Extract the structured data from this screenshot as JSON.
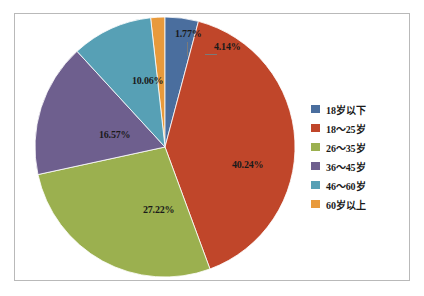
{
  "chart_data": {
    "type": "pie",
    "title": "",
    "xlabel": "",
    "ylabel": "",
    "legend_position": "right",
    "grid": false,
    "categories": [
      "18岁以下",
      "18～25岁",
      "26～35岁",
      "36～45岁",
      "46～60岁",
      "60岁以上"
    ],
    "values": [
      4.14,
      40.24,
      27.22,
      16.57,
      10.06,
      1.77
    ],
    "value_labels": [
      "4.14%",
      "40.24%",
      "27.22%",
      "16.57%",
      "10.06%",
      "1.77%"
    ],
    "colors": [
      "#4a6e9e",
      "#c0462a",
      "#9bb04f",
      "#6e5f8e",
      "#57a0b5",
      "#e89a3c"
    ],
    "units": "percent",
    "total": 100.0
  },
  "legend": {
    "items": [
      {
        "label": "18岁以下",
        "color": "#4a6e9e"
      },
      {
        "label": "18～25岁",
        "color": "#c0462a"
      },
      {
        "label": "26～35岁",
        "color": "#9bb04f"
      },
      {
        "label": "36～45岁",
        "color": "#6e5f8e"
      },
      {
        "label": "46～60岁",
        "color": "#57a0b5"
      },
      {
        "label": "60岁以上",
        "color": "#e89a3c"
      }
    ]
  },
  "labels": {
    "blue": "4.14%",
    "red": "40.24%",
    "green": "27.22%",
    "purple": "16.57%",
    "teal": "10.06%",
    "orange": "1.77%"
  },
  "style": {
    "frame_color": "#b9b9b9",
    "background": "#ffffff",
    "text_color": "#1a1a1a"
  }
}
